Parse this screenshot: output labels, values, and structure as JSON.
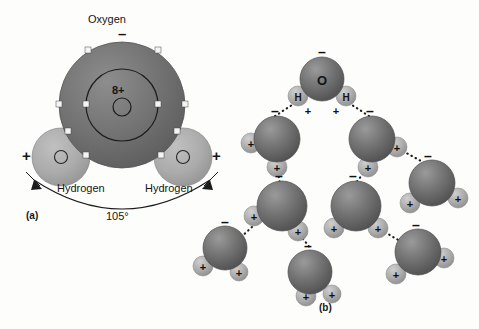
{
  "figure": {
    "background_color": "#fdfdfc",
    "oxygen_color": "#6e6e6e",
    "hydrogen_color": "#a8a8a8",
    "outline_color": "#151515"
  },
  "panel_a": {
    "tag": "(a)",
    "oxygen_label": "Oxygen",
    "oxygen_charge": "–",
    "nucleus_label": "8+",
    "hydrogen_label_left": "Hydrogen",
    "hydrogen_label_right": "Hydrogen",
    "hydrogen_charge_left": "+",
    "hydrogen_charge_right": "+",
    "bond_angle": "105°",
    "shells": [
      {
        "name": "inner-shell",
        "electron_count": 2
      },
      {
        "name": "outer-shell",
        "electron_count": 8
      }
    ]
  },
  "panel_b": {
    "tag": "(b)",
    "oxygen_letter": "O",
    "hydrogen_letter": "H",
    "negative_sign": "–",
    "positive_sign": "+",
    "molecules": [
      {
        "id": "molecule-top",
        "ox": 322,
        "oy": 79,
        "r": 22,
        "neg_dx": 0,
        "neg_dy": -27,
        "labeled": true,
        "hydrogens": [
          {
            "dx": -24,
            "dy": 17,
            "r": 10,
            "sign_dx": -14,
            "sign_dy": 31
          },
          {
            "dx": 24,
            "dy": 17,
            "r": 10,
            "sign_dx": 14,
            "sign_dy": 31
          }
        ]
      },
      {
        "id": "molecule-upper-left",
        "ox": 277,
        "oy": 139,
        "r": 23,
        "neg_dx": -2,
        "neg_dy": -28,
        "labeled": false,
        "hydrogens": [
          {
            "dx": -26,
            "dy": 4,
            "r": 10,
            "sign_dx": -26,
            "sign_dy": 4
          },
          {
            "dx": 0,
            "dy": 28,
            "r": 10,
            "sign_dx": 0,
            "sign_dy": 28
          }
        ]
      },
      {
        "id": "molecule-upper-right",
        "ox": 372,
        "oy": 139,
        "r": 23,
        "neg_dx": -2,
        "neg_dy": -28,
        "labeled": false,
        "hydrogens": [
          {
            "dx": 25,
            "dy": 8,
            "r": 10,
            "sign_dx": 25,
            "sign_dy": 8
          },
          {
            "dx": -4,
            "dy": 28,
            "r": 10,
            "sign_dx": -4,
            "sign_dy": 28
          }
        ]
      },
      {
        "id": "molecule-far-right",
        "ox": 432,
        "oy": 183,
        "r": 23,
        "neg_dx": -4,
        "neg_dy": -27,
        "labeled": false,
        "hydrogens": [
          {
            "dx": -22,
            "dy": 20,
            "r": 10,
            "sign_dx": -22,
            "sign_dy": 20
          },
          {
            "dx": 26,
            "dy": 15,
            "r": 10,
            "sign_dx": 26,
            "sign_dy": 15
          }
        ]
      },
      {
        "id": "molecule-mid-left",
        "ox": 282,
        "oy": 206,
        "r": 25,
        "neg_dx": -3,
        "neg_dy": -30,
        "labeled": false,
        "hydrogens": [
          {
            "dx": -28,
            "dy": 10,
            "r": 10,
            "sign_dx": -28,
            "sign_dy": 10
          },
          {
            "dx": 16,
            "dy": 25,
            "r": 10,
            "sign_dx": 16,
            "sign_dy": 25
          }
        ]
      },
      {
        "id": "molecule-mid-center",
        "ox": 356,
        "oy": 206,
        "r": 25,
        "neg_dx": -3,
        "neg_dy": -30,
        "labeled": false,
        "hydrogens": [
          {
            "dx": -22,
            "dy": 22,
            "r": 10,
            "sign_dx": -22,
            "sign_dy": 22
          },
          {
            "dx": 22,
            "dy": 22,
            "r": 10,
            "sign_dx": 22,
            "sign_dy": 22
          }
        ]
      },
      {
        "id": "molecule-bottom-left",
        "ox": 225,
        "oy": 248,
        "r": 22,
        "neg_dx": 0,
        "neg_dy": -26,
        "labeled": false,
        "hydrogens": [
          {
            "dx": -22,
            "dy": 18,
            "r": 10,
            "sign_dx": -22,
            "sign_dy": 18
          },
          {
            "dx": 14,
            "dy": 24,
            "r": 9,
            "sign_dx": 14,
            "sign_dy": 24
          }
        ]
      },
      {
        "id": "molecule-bottom-center",
        "ox": 310,
        "oy": 272,
        "r": 22,
        "neg_dx": -2,
        "neg_dy": -26,
        "labeled": false,
        "hydrogens": [
          {
            "dx": -4,
            "dy": 24,
            "r": 10,
            "sign_dx": -4,
            "sign_dy": 24
          },
          {
            "dx": 22,
            "dy": 22,
            "r": 9,
            "sign_dx": 22,
            "sign_dy": 22
          }
        ]
      },
      {
        "id": "molecule-bottom-right",
        "ox": 418,
        "oy": 252,
        "r": 23,
        "neg_dx": -2,
        "neg_dy": -27,
        "labeled": false,
        "hydrogens": [
          {
            "dx": -22,
            "dy": 22,
            "r": 10,
            "sign_dx": -22,
            "sign_dy": 22
          },
          {
            "dx": 26,
            "dy": 6,
            "r": 10,
            "sign_dx": 26,
            "sign_dy": 6
          }
        ]
      }
    ],
    "hydrogen_bonds": [
      {
        "id": "bond-top-to-upper-left",
        "x1": 295,
        "y1": 103,
        "x2": 272,
        "y2": 118
      },
      {
        "id": "bond-top-to-upper-right",
        "x1": 349,
        "y1": 103,
        "x2": 372,
        "y2": 118
      },
      {
        "id": "bond-upper-right-to-far-right",
        "x1": 399,
        "y1": 149,
        "x2": 421,
        "y2": 161
      },
      {
        "id": "bond-upper-left-to-mid-left",
        "x1": 278,
        "y1": 172,
        "x2": 280,
        "y2": 184
      },
      {
        "id": "bond-upper-right-to-mid-center",
        "x1": 366,
        "y1": 170,
        "x2": 355,
        "y2": 184
      },
      {
        "id": "bond-mid-left-to-bottom-left",
        "x1": 252,
        "y1": 227,
        "x2": 240,
        "y2": 238
      },
      {
        "id": "bond-mid-left-to-bottom-center",
        "x1": 300,
        "y1": 235,
        "x2": 311,
        "y2": 249
      },
      {
        "id": "bond-mid-center-to-bottom-right",
        "x1": 381,
        "y1": 230,
        "x2": 400,
        "y2": 241
      }
    ]
  }
}
